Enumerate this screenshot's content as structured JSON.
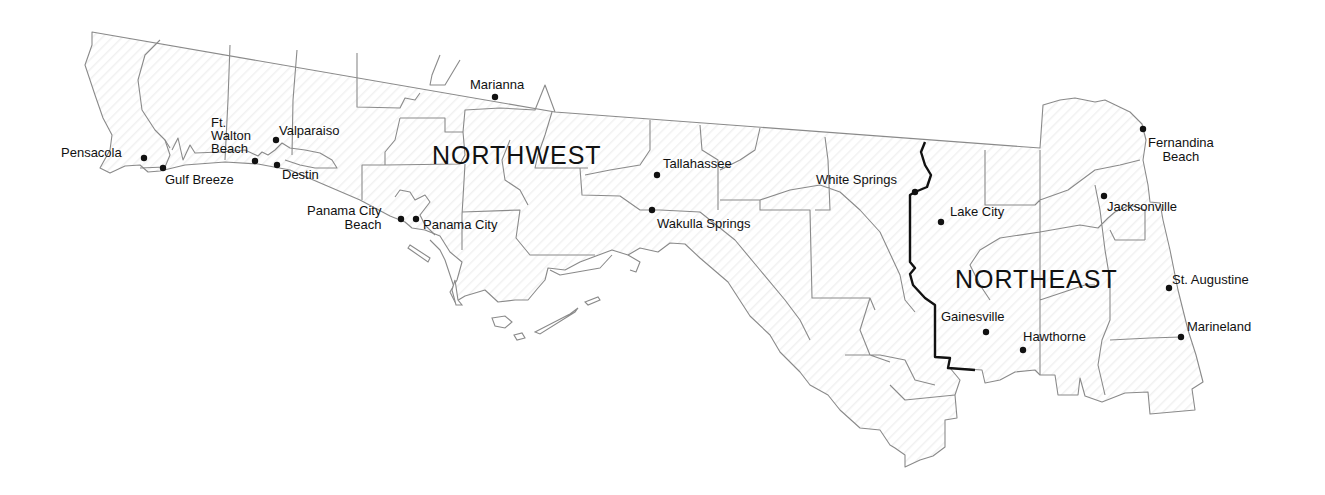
{
  "map": {
    "regions": [
      {
        "id": "northwest",
        "label": "NORTHWEST",
        "x": 432,
        "y": 141
      },
      {
        "id": "northeast",
        "label": "NORTHEAST",
        "x": 955,
        "y": 265
      }
    ],
    "cities": [
      {
        "id": "pensacola",
        "label": "Pensacola",
        "dot": [
          144,
          158
        ],
        "lx": 61,
        "ly": 146
      },
      {
        "id": "gulf-breeze",
        "label": "Gulf Breeze",
        "dot": [
          163,
          168
        ],
        "lx": 165,
        "ly": 173
      },
      {
        "id": "ft-walton-beach",
        "label": "Ft.\nWalton\nBeach",
        "dot": [
          255,
          161
        ],
        "lx": 211,
        "ly": 116
      },
      {
        "id": "valparaiso",
        "label": "Valparaiso",
        "dot": [
          276,
          140
        ],
        "lx": 279,
        "ly": 124
      },
      {
        "id": "destin",
        "label": "Destin",
        "dot": [
          277,
          165
        ],
        "lx": 282,
        "ly": 168
      },
      {
        "id": "panama-city-beach",
        "label": "Panama City\nBeach",
        "dot": [
          401,
          219
        ],
        "lx": 307,
        "ly": 204
      },
      {
        "id": "panama-city",
        "label": "Panama City",
        "dot": [
          416,
          219
        ],
        "lx": 423,
        "ly": 218
      },
      {
        "id": "marianna",
        "label": "Marianna",
        "dot": [
          495,
          97
        ],
        "lx": 470,
        "ly": 78
      },
      {
        "id": "tallahassee",
        "label": "Tallahassee",
        "dot": [
          657,
          175
        ],
        "lx": 663,
        "ly": 157
      },
      {
        "id": "wakulla-springs",
        "label": "Wakulla Springs",
        "dot": [
          652,
          210
        ],
        "lx": 657,
        "ly": 217
      },
      {
        "id": "white-springs",
        "label": "White Springs",
        "dot": [
          915,
          192
        ],
        "lx": 816,
        "ly": 173
      },
      {
        "id": "lake-city",
        "label": "Lake City",
        "dot": [
          941,
          222
        ],
        "lx": 950,
        "ly": 205
      },
      {
        "id": "gainesville",
        "label": "Gainesville",
        "dot": [
          986,
          332
        ],
        "lx": 941,
        "ly": 310
      },
      {
        "id": "hawthorne",
        "label": "Hawthorne",
        "dot": [
          1023,
          350
        ],
        "lx": 1023,
        "ly": 330
      },
      {
        "id": "fernandina-beach",
        "label": "Fernandina\nBeach",
        "dot": [
          1143,
          129
        ],
        "lx": 1148,
        "ly": 136
      },
      {
        "id": "jacksonville",
        "label": "Jacksonville",
        "dot": [
          1104,
          196
        ],
        "lx": 1107,
        "ly": 200
      },
      {
        "id": "st-augustine",
        "label": "St. Augustine",
        "dot": [
          1169,
          288
        ],
        "lx": 1172,
        "ly": 273
      },
      {
        "id": "marineland",
        "label": "Marineland",
        "dot": [
          1181,
          337
        ],
        "lx": 1187,
        "ly": 320
      }
    ]
  },
  "colors": {
    "background": "#ffffff",
    "county_line": "#8a8a8a",
    "region_divider": "#111111",
    "text": "#111111"
  }
}
